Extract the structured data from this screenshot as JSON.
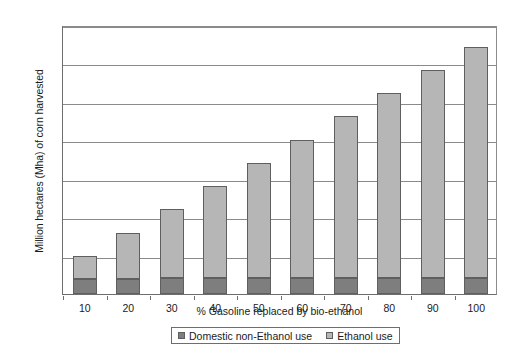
{
  "chart_data": {
    "type": "bar",
    "subtype": "stacked-column",
    "title": "",
    "xlabel": "% Gasoline replaced by bio-ethanol",
    "ylabel": "Million hectares (Mha) of corn harvested",
    "categories": [
      "10",
      "20",
      "30",
      "40",
      "50",
      "60",
      "70",
      "80",
      "90",
      "100"
    ],
    "series": [
      {
        "name": "Domestic non-Ethanol use",
        "color": "#7e7e7e",
        "values": [
          20,
          20,
          21,
          21,
          21,
          21,
          21,
          21,
          21,
          21
        ]
      },
      {
        "name": "Ethanol use",
        "color": "#b6b6b6",
        "values": [
          30,
          60,
          90,
          120,
          150,
          179,
          211,
          241,
          271,
          301
        ]
      }
    ],
    "totals": [
      50,
      80,
      111,
      141,
      171,
      200,
      232,
      262,
      292,
      322
    ],
    "ylim": [
      0,
      350
    ],
    "yticks": [
      "0",
      "50",
      "100",
      "150",
      "200",
      "250",
      "300",
      "350"
    ],
    "ytick_values": [
      0,
      50,
      100,
      150,
      200,
      250,
      300,
      350
    ],
    "grid": "horizontal",
    "legend_position": "bottom"
  },
  "axes": {
    "y_title": "Million hectares (Mha) of corn harvested",
    "x_title": "% Gasoline replaced by bio-ethanol"
  },
  "legend": {
    "items": [
      {
        "label": "Domestic non-Ethanol use",
        "color": "#7e7e7e"
      },
      {
        "label": "Ethanol use",
        "color": "#b6b6b6"
      }
    ]
  }
}
